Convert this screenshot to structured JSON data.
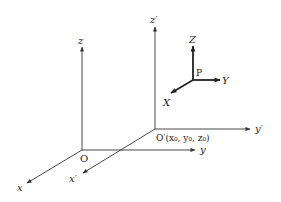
{
  "diagram": {
    "type": "coordinate-frames",
    "colors": {
      "line": "#333333",
      "text": "#222222",
      "background": "#ffffff"
    },
    "frame_O": {
      "origin_label": "O",
      "axes": {
        "x": "x",
        "y": "y",
        "z": "z"
      }
    },
    "frame_O_prime": {
      "origin_label": "O′(x₀, y₀, z₀)",
      "axes": {
        "x": "x′",
        "y": "y′",
        "z": "z′"
      }
    },
    "frame_P": {
      "origin_label": "P",
      "axes": {
        "X": "X",
        "Y": "Y",
        "Z": "Z"
      }
    }
  }
}
